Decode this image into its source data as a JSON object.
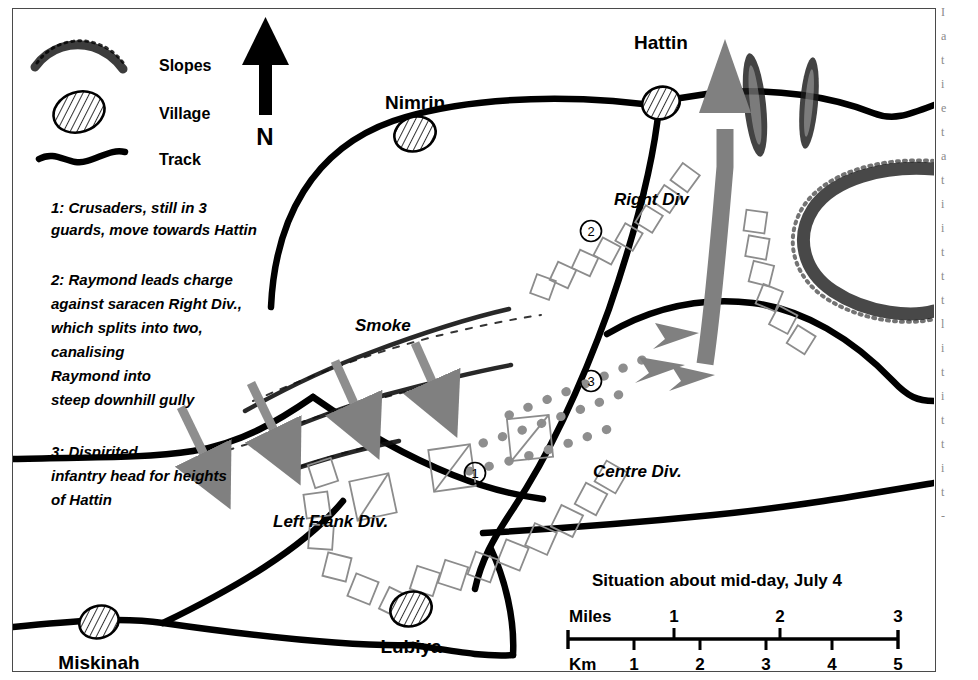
{
  "map": {
    "legend": {
      "items": [
        {
          "symbol": "slopes-symbol",
          "label": "Slopes"
        },
        {
          "symbol": "village-symbol",
          "label": "Village"
        },
        {
          "symbol": "track-symbol",
          "label": "Track"
        }
      ]
    },
    "compass": {
      "label": "N"
    },
    "notes": [
      {
        "id": "1",
        "lines": [
          "1: Crusaders, still in 3",
          " guards, move towards Hattin"
        ]
      },
      {
        "id": "2",
        "lines": [
          "2: Raymond leads charge",
          "against saracen Right Div.,",
          "which splits into two,",
          "canalising",
          "Raymond into",
          "steep downhill gully"
        ]
      },
      {
        "id": "3",
        "lines": [
          "3: Dispirited",
          "infantry head for heights",
          "of Hattin"
        ]
      }
    ],
    "places": [
      {
        "name": "Nimrin",
        "type": "village"
      },
      {
        "name": "Hattin",
        "type": "village"
      },
      {
        "name": "Miskinah",
        "type": "village"
      },
      {
        "name": "Lubiya",
        "type": "village"
      }
    ],
    "formations": [
      {
        "label": "Right Div"
      },
      {
        "label": "Centre Div."
      },
      {
        "label": "Left Flank Div."
      }
    ],
    "annotations": [
      {
        "label": "Smoke"
      },
      {
        "marker": "1"
      },
      {
        "marker": "2"
      },
      {
        "marker": "3"
      }
    ],
    "caption": "Situation about mid-day, July 4",
    "scale": {
      "miles_label": "Miles",
      "miles_ticks": [
        "1",
        "2",
        "3"
      ],
      "km_label": "Km",
      "km_ticks": [
        "1",
        "2",
        "3",
        "4",
        "5"
      ]
    },
    "colors": {
      "ink": "#000000",
      "arrow_gray": "#808080",
      "unit_outline": "#8c8c8c",
      "frame": "#4a4a4a"
    }
  },
  "page_margin": {
    "fragments": [
      "I",
      "a",
      "t",
      "i",
      "e",
      "t",
      "a",
      "t",
      "i",
      "i",
      "t",
      "t",
      "t",
      "l",
      "i",
      "t",
      "i",
      "t",
      "t",
      "i",
      "t",
      "-"
    ]
  }
}
